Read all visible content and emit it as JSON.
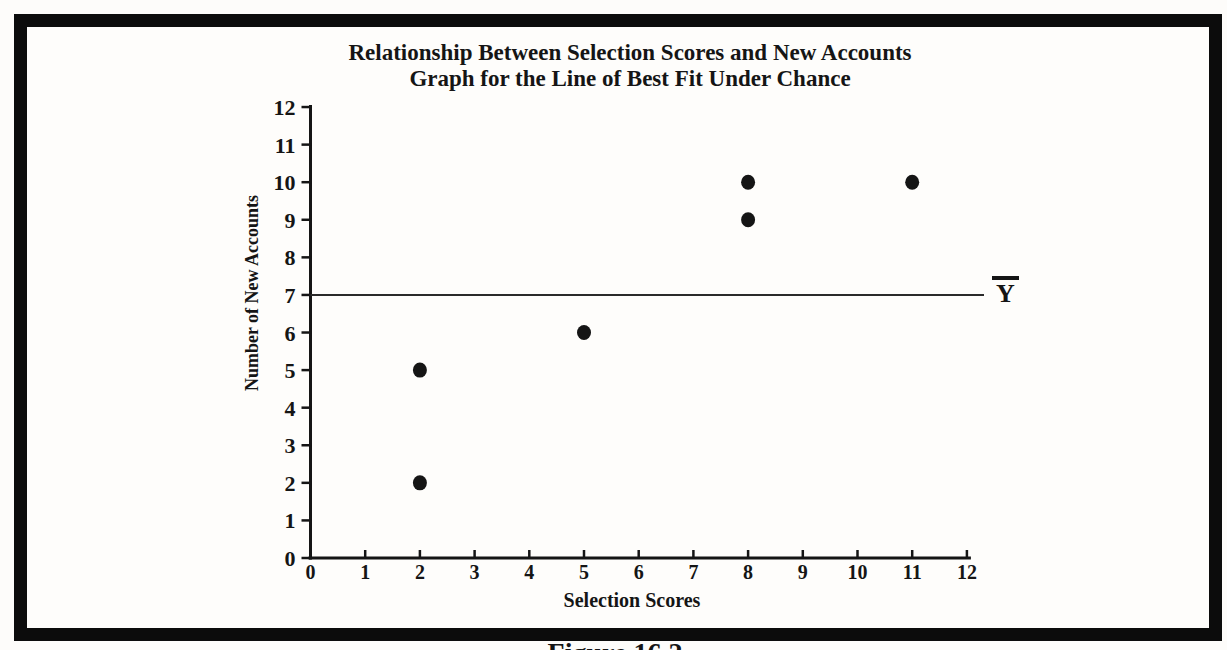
{
  "page": {
    "caption": "Figure 16.2"
  },
  "chart_data": {
    "type": "scatter",
    "title": "Relationship Between Selection Scores and New Accounts",
    "subtitle": "Graph for the Line of Best Fit Under Chance",
    "xlabel": "Selection Scores",
    "ylabel": "Number of New Accounts",
    "xlim": [
      0,
      12
    ],
    "ylim": [
      0,
      12
    ],
    "xticks": [
      0,
      1,
      2,
      3,
      4,
      5,
      6,
      7,
      8,
      9,
      10,
      11,
      12
    ],
    "yticks": [
      0,
      1,
      2,
      3,
      4,
      5,
      6,
      7,
      8,
      9,
      10,
      11,
      12
    ],
    "points": [
      {
        "x": 2,
        "y": 2
      },
      {
        "x": 2,
        "y": 5
      },
      {
        "x": 5,
        "y": 6
      },
      {
        "x": 8,
        "y": 9
      },
      {
        "x": 8,
        "y": 10
      },
      {
        "x": 11,
        "y": 10
      }
    ],
    "reference_line": {
      "y": 7,
      "label": "Y",
      "has_overbar": true
    },
    "grid": false,
    "legend_position": "none",
    "colors": {
      "ink": "#151515",
      "frame": "#0c0c0c",
      "paper": "#fefdfb",
      "reference_line": "#2a2a2a"
    }
  }
}
